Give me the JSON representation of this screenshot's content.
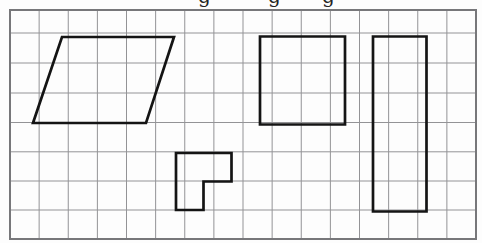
{
  "canvas": {
    "width": 482,
    "height": 243,
    "background": "#fdfdfd"
  },
  "title_fragment": {
    "note": "bottom descender loops of a cropped title line above the grid",
    "color": "#242424",
    "font_size": 20,
    "baseline_y": 2.5,
    "letters": [
      {
        "char": "g",
        "x": 198
      },
      {
        "char": "g",
        "x": 268
      },
      {
        "char": "g",
        "x": 322
      }
    ]
  },
  "grid": {
    "left": 10,
    "top": 10,
    "right": 476,
    "bottom": 239,
    "columns": 16,
    "row_lines": [
      33,
      63,
      93,
      122.5,
      151.8,
      181,
      210
    ],
    "line_color": "#939396",
    "line_width": 1,
    "border_color": "#77777a",
    "border_width": 2
  },
  "shapes": {
    "stroke_color": "#141414",
    "stroke_width": 2.7,
    "fill": "none",
    "items": [
      {
        "name": "parallelogram",
        "points": [
          [
            62,
            37
          ],
          [
            174,
            37
          ],
          [
            146,
            123
          ],
          [
            33,
            123
          ]
        ]
      },
      {
        "name": "square",
        "points": [
          [
            260,
            36.5
          ],
          [
            345,
            36.5
          ],
          [
            345,
            124.5
          ],
          [
            260,
            124.5
          ]
        ]
      },
      {
        "name": "tall-rectangle",
        "points": [
          [
            373,
            36.5
          ],
          [
            426.5,
            36.5
          ],
          [
            426.5,
            211.5
          ],
          [
            373,
            211.5
          ]
        ]
      },
      {
        "name": "l-shape",
        "points": [
          [
            176,
            153
          ],
          [
            231.5,
            153
          ],
          [
            231.5,
            181.5
          ],
          [
            203.5,
            181.5
          ],
          [
            203.5,
            210
          ],
          [
            176,
            210
          ]
        ]
      }
    ]
  }
}
